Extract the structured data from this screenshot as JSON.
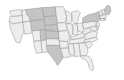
{
  "figure": {
    "kind": "choropleth-map",
    "region": "Contiguous United States",
    "title": "",
    "background_color": "#ffffff",
    "border_color": "#9a9a9a",
    "width_px": 124,
    "height_px": 80
  },
  "chart_data": {
    "type": "map",
    "subtype": "choropleth",
    "title": "",
    "subtitle": "",
    "xlabel": "",
    "ylabel": "",
    "legend": [],
    "grid": false,
    "projection": "albers-usa-like",
    "color_scale": {
      "kind": "grayscale",
      "light": "#ededed",
      "medium_light": "#dcdcdc",
      "medium": "#c4c4c4",
      "dark": "#adadad",
      "outline": "#9a9a9a",
      "background": "#ffffff"
    },
    "categories": [
      "WA",
      "OR",
      "CA",
      "NV",
      "ID",
      "MT",
      "WY",
      "UT",
      "AZ",
      "CO",
      "NM",
      "ND",
      "SD",
      "NE",
      "KS",
      "OK",
      "TX",
      "MN",
      "IA",
      "MO",
      "AR",
      "LA",
      "WI",
      "IL",
      "MI",
      "IN",
      "OH",
      "KY",
      "TN",
      "MS",
      "AL",
      "GA",
      "FL",
      "SC",
      "NC",
      "VA",
      "WV",
      "PA",
      "NY",
      "VT",
      "NH",
      "ME",
      "MA",
      "RI",
      "CT",
      "NJ",
      "DE",
      "MD"
    ],
    "values": [
      1,
      1,
      1,
      1,
      1,
      2,
      2,
      1,
      1,
      2,
      1,
      2,
      2,
      2,
      2,
      1,
      2,
      1,
      1,
      1,
      1,
      1,
      1,
      1,
      1,
      1,
      1,
      1,
      1,
      1,
      1,
      1,
      1,
      1,
      1,
      1,
      1,
      1,
      2,
      1,
      1,
      2,
      1,
      1,
      1,
      1,
      1,
      1
    ],
    "states": [
      {
        "code": "WA",
        "name": "Washington",
        "shade": "light",
        "fill": "#ededed"
      },
      {
        "code": "OR",
        "name": "Oregon",
        "shade": "light",
        "fill": "#ededed"
      },
      {
        "code": "CA",
        "name": "California",
        "shade": "light",
        "fill": "#ededed"
      },
      {
        "code": "NV",
        "name": "Nevada",
        "shade": "light",
        "fill": "#ededed"
      },
      {
        "code": "ID",
        "name": "Idaho",
        "shade": "light",
        "fill": "#ededed"
      },
      {
        "code": "MT",
        "name": "Montana",
        "shade": "medium",
        "fill": "#c4c4c4"
      },
      {
        "code": "WY",
        "name": "Wyoming",
        "shade": "medium",
        "fill": "#c4c4c4"
      },
      {
        "code": "UT",
        "name": "Utah",
        "shade": "light",
        "fill": "#ededed"
      },
      {
        "code": "AZ",
        "name": "Arizona",
        "shade": "light",
        "fill": "#ededed"
      },
      {
        "code": "CO",
        "name": "Colorado",
        "shade": "medium",
        "fill": "#c4c4c4"
      },
      {
        "code": "NM",
        "name": "New Mexico",
        "shade": "light",
        "fill": "#ededed"
      },
      {
        "code": "ND",
        "name": "North Dakota",
        "shade": "medium",
        "fill": "#c4c4c4"
      },
      {
        "code": "SD",
        "name": "South Dakota",
        "shade": "medium",
        "fill": "#c4c4c4"
      },
      {
        "code": "NE",
        "name": "Nebraska",
        "shade": "medium",
        "fill": "#c4c4c4"
      },
      {
        "code": "KS",
        "name": "Kansas",
        "shade": "medium",
        "fill": "#c4c4c4"
      },
      {
        "code": "OK",
        "name": "Oklahoma",
        "shade": "light",
        "fill": "#ededed"
      },
      {
        "code": "TX",
        "name": "Texas",
        "shade": "medium",
        "fill": "#c4c4c4"
      },
      {
        "code": "MN",
        "name": "Minnesota",
        "shade": "light",
        "fill": "#ededed"
      },
      {
        "code": "IA",
        "name": "Iowa",
        "shade": "light",
        "fill": "#ededed"
      },
      {
        "code": "MO",
        "name": "Missouri",
        "shade": "light",
        "fill": "#ededed"
      },
      {
        "code": "AR",
        "name": "Arkansas",
        "shade": "light",
        "fill": "#ededed"
      },
      {
        "code": "LA",
        "name": "Louisiana",
        "shade": "light",
        "fill": "#ededed"
      },
      {
        "code": "WI",
        "name": "Wisconsin",
        "shade": "light",
        "fill": "#ededed"
      },
      {
        "code": "IL",
        "name": "Illinois",
        "shade": "light",
        "fill": "#ededed"
      },
      {
        "code": "MI",
        "name": "Michigan",
        "shade": "light",
        "fill": "#ededed"
      },
      {
        "code": "IN",
        "name": "Indiana",
        "shade": "light",
        "fill": "#ededed"
      },
      {
        "code": "OH",
        "name": "Ohio",
        "shade": "light",
        "fill": "#ededed"
      },
      {
        "code": "KY",
        "name": "Kentucky",
        "shade": "light",
        "fill": "#ededed"
      },
      {
        "code": "TN",
        "name": "Tennessee",
        "shade": "light",
        "fill": "#ededed"
      },
      {
        "code": "MS",
        "name": "Mississippi",
        "shade": "light",
        "fill": "#ededed"
      },
      {
        "code": "AL",
        "name": "Alabama",
        "shade": "light",
        "fill": "#ededed"
      },
      {
        "code": "GA",
        "name": "Georgia",
        "shade": "light",
        "fill": "#ededed"
      },
      {
        "code": "FL",
        "name": "Florida",
        "shade": "light",
        "fill": "#ededed"
      },
      {
        "code": "SC",
        "name": "South Carolina",
        "shade": "light",
        "fill": "#ededed"
      },
      {
        "code": "NC",
        "name": "North Carolina",
        "shade": "light",
        "fill": "#ededed"
      },
      {
        "code": "VA",
        "name": "Virginia",
        "shade": "light",
        "fill": "#ededed"
      },
      {
        "code": "WV",
        "name": "West Virginia",
        "shade": "light",
        "fill": "#ededed"
      },
      {
        "code": "PA",
        "name": "Pennsylvania",
        "shade": "light",
        "fill": "#ededed"
      },
      {
        "code": "NY",
        "name": "New York",
        "shade": "medium",
        "fill": "#c4c4c4"
      },
      {
        "code": "VT",
        "name": "Vermont",
        "shade": "light",
        "fill": "#ededed"
      },
      {
        "code": "NH",
        "name": "New Hampshire",
        "shade": "light",
        "fill": "#ededed"
      },
      {
        "code": "ME",
        "name": "Maine",
        "shade": "medium",
        "fill": "#c4c4c4"
      },
      {
        "code": "MA",
        "name": "Massachusetts",
        "shade": "light",
        "fill": "#ededed"
      },
      {
        "code": "RI",
        "name": "Rhode Island",
        "shade": "light",
        "fill": "#ededed"
      },
      {
        "code": "CT",
        "name": "Connecticut",
        "shade": "light",
        "fill": "#ededed"
      },
      {
        "code": "NJ",
        "name": "New Jersey",
        "shade": "light",
        "fill": "#ededed"
      },
      {
        "code": "DE",
        "name": "Delaware",
        "shade": "light",
        "fill": "#ededed"
      },
      {
        "code": "MD",
        "name": "Maryland",
        "shade": "light",
        "fill": "#ededed"
      }
    ]
  }
}
